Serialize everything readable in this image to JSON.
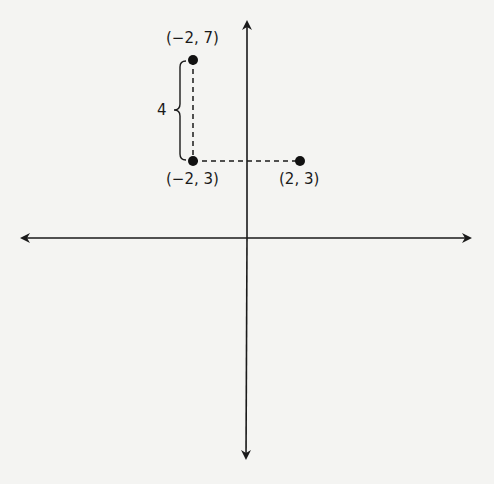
{
  "diagram": {
    "type": "coordinate-plane",
    "points": [
      {
        "label": "(−2, 7)",
        "x": -2,
        "y": 7
      },
      {
        "label": "(−2, 3)",
        "x": -2,
        "y": 3
      },
      {
        "label": "(2, 3)",
        "x": 2,
        "y": 3
      }
    ],
    "brace_label": "4",
    "colors": {
      "ink": "#1a1a1a",
      "background": "#f4f4f2"
    }
  }
}
